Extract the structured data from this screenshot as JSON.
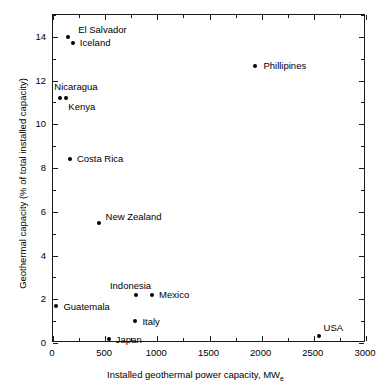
{
  "chart_data": {
    "type": "scatter",
    "title": "",
    "xlabel": "Installed geothermal power capacity, MW",
    "xlabel_sub": "e",
    "ylabel": "Geothermal capacity (% of total installed capacity)",
    "xlim": [
      0,
      3000
    ],
    "ylim": [
      0,
      15
    ],
    "xticks": [
      0,
      500,
      1000,
      1500,
      2000,
      2500,
      3000
    ],
    "xtick_labels": [
      "0",
      "500",
      "1000",
      "1500",
      "2000",
      "2500",
      "3000"
    ],
    "xminor_ticks": [
      250,
      750,
      1250,
      1750,
      2250,
      2750
    ],
    "yticks": [
      0,
      2,
      4,
      6,
      8,
      10,
      12,
      14
    ],
    "ytick_labels": [
      "0",
      "2",
      "4",
      "6",
      "8",
      "10",
      "12",
      "14"
    ],
    "yminor_ticks": [
      1,
      3,
      5,
      7,
      9,
      11,
      13,
      15
    ],
    "grid": false,
    "legend": false,
    "marker_color": "#000000",
    "points": [
      {
        "label": "El Salvador",
        "x": 145,
        "y": 14.0,
        "label_dx": 10,
        "label_dy": -13
      },
      {
        "label": "Iceland",
        "x": 190,
        "y": 13.7,
        "label_dx": 7,
        "label_dy": -6
      },
      {
        "label": "Phillipines",
        "x": 1940,
        "y": 12.65,
        "label_dx": 8,
        "label_dy": -6
      },
      {
        "label": "Nicaragua",
        "x": 70,
        "y": 11.2,
        "label_dx": -6,
        "label_dy": -17
      },
      {
        "label": "Kenya",
        "x": 128,
        "y": 11.2,
        "label_dx": 2,
        "label_dy": 3
      },
      {
        "label": "Costa Rica",
        "x": 162,
        "y": 8.4,
        "label_dx": 7,
        "label_dy": -6
      },
      {
        "label": "New Zealand",
        "x": 437,
        "y": 5.5,
        "label_dx": 7,
        "label_dy": -12
      },
      {
        "label": "Indonesia",
        "x": 795,
        "y": 2.2,
        "label_dx": -26,
        "label_dy": -15
      },
      {
        "label": "Mexico",
        "x": 950,
        "y": 2.2,
        "label_dx": 7,
        "label_dy": -6
      },
      {
        "label": "Guatemala",
        "x": 33,
        "y": 1.7,
        "label_dx": 7,
        "label_dy": -5
      },
      {
        "label": "Italy",
        "x": 790,
        "y": 1.0,
        "label_dx": 7,
        "label_dy": -5
      },
      {
        "label": "Japan",
        "x": 535,
        "y": 0.2,
        "label_dx": 7,
        "label_dy": -5
      },
      {
        "label": "USA",
        "x": 2545,
        "y": 0.3,
        "label_dx": 5,
        "label_dy": -14
      }
    ]
  }
}
